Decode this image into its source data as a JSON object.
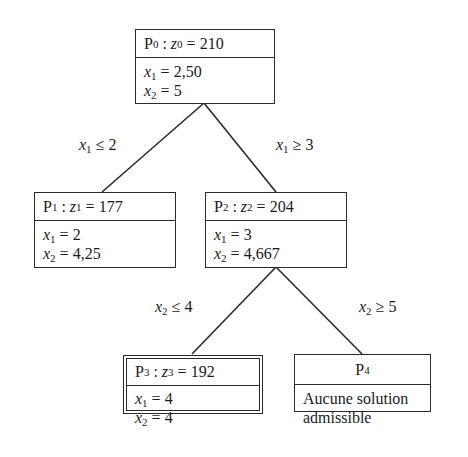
{
  "diagram": {
    "type": "branch-and-bound-tree",
    "nodes": [
      {
        "id": "P0",
        "title": "P",
        "sub": "0",
        "obj_var": "z",
        "obj_sub": "0",
        "obj_value": "210",
        "vars": [
          {
            "name": "x",
            "sub": "1",
            "value": "2,50"
          },
          {
            "name": "x",
            "sub": "2",
            "value": "5"
          }
        ]
      },
      {
        "id": "P1",
        "title": "P",
        "sub": "1",
        "obj_var": "z",
        "obj_sub": "1",
        "obj_value": "177",
        "vars": [
          {
            "name": "x",
            "sub": "1",
            "value": "2"
          },
          {
            "name": "x",
            "sub": "2",
            "value": "4,25"
          }
        ]
      },
      {
        "id": "P2",
        "title": "P",
        "sub": "2",
        "obj_var": "z",
        "obj_sub": "2",
        "obj_value": "204",
        "vars": [
          {
            "name": "x",
            "sub": "1",
            "value": "3"
          },
          {
            "name": "x",
            "sub": "2",
            "value": "4,667"
          }
        ]
      },
      {
        "id": "P3",
        "title": "P",
        "sub": "3",
        "obj_var": "z",
        "obj_sub": "3",
        "obj_value": "192",
        "vars": [
          {
            "name": "x",
            "sub": "1",
            "value": "4"
          },
          {
            "name": "x",
            "sub": "2",
            "value": "4"
          }
        ]
      },
      {
        "id": "P4",
        "title": "P",
        "sub": "4",
        "text_line1": "Aucune solution",
        "text_line2": "admissible"
      }
    ],
    "edges": [
      {
        "from": "P0",
        "to": "P1",
        "var": "x",
        "sub": "1",
        "op": "≤",
        "value": "2"
      },
      {
        "from": "P0",
        "to": "P2",
        "var": "x",
        "sub": "1",
        "op": "≥",
        "value": "3"
      },
      {
        "from": "P2",
        "to": "P3",
        "var": "x",
        "sub": "2",
        "op": "≤",
        "value": "4"
      },
      {
        "from": "P2",
        "to": "P4",
        "var": "x",
        "sub": "2",
        "op": "≥",
        "value": "5"
      }
    ],
    "symbols": {
      "colon": ":",
      "equals": "="
    }
  }
}
